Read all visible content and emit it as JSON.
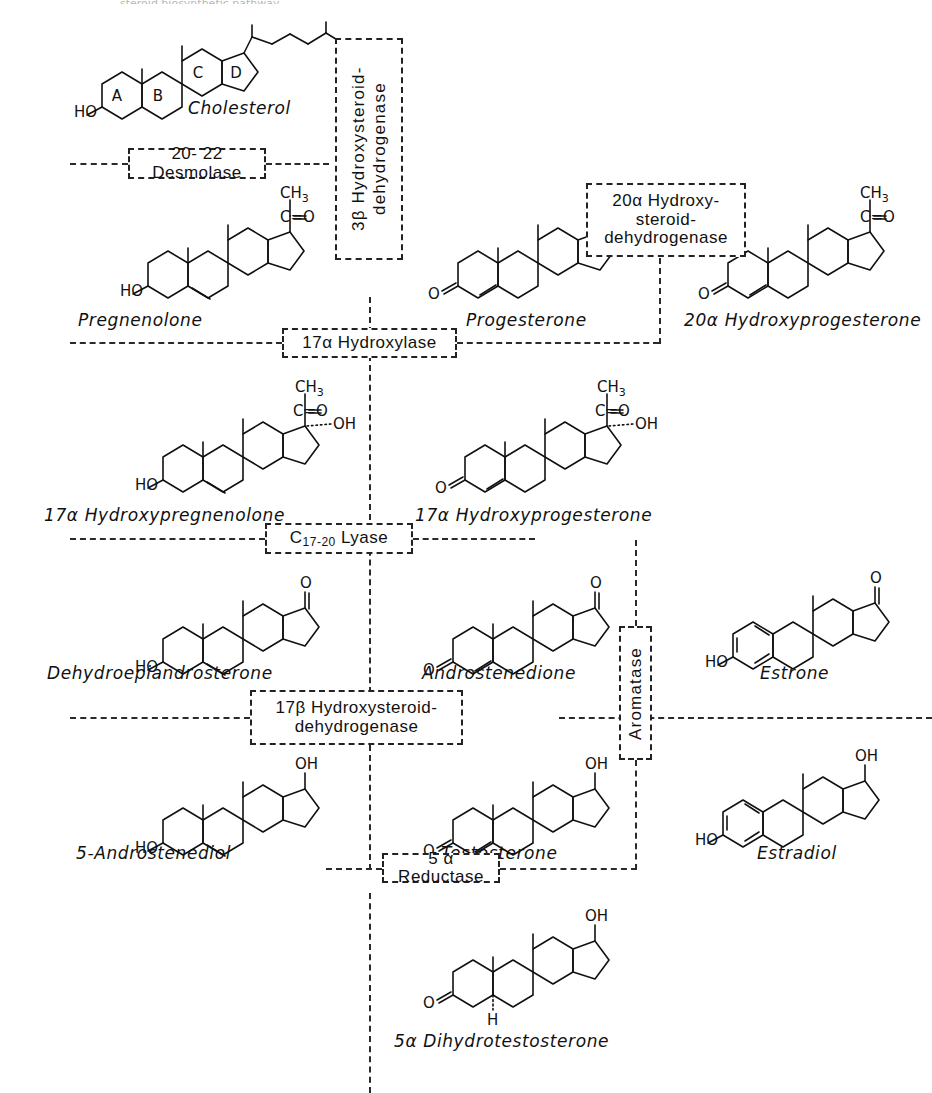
{
  "figure": {
    "title_cropped": "steroid biosynthetic pathway",
    "domain": "biochemistry-pathway-diagram",
    "background_color": "#ffffff",
    "ink_color": "#111111"
  },
  "enzymes": [
    {
      "id": "desmolase",
      "name": "20-22 Desmolase",
      "label": "20- 22 Desmolase",
      "orientation": "horizontal"
    },
    {
      "id": "hsd3b",
      "name": "3-beta Hydroxysteroid dehydrogenase",
      "label": "3β Hydroxysteroid-\ndehydrogenase",
      "orientation": "vertical"
    },
    {
      "id": "hsd20a",
      "name": "20-alpha Hydroxysteroid dehydrogenase",
      "label": "20α Hydroxy-\nsteroid-\ndehydrogenase",
      "orientation": "horizontal"
    },
    {
      "id": "cyp17_hydroxylase",
      "name": "17-alpha Hydroxylase",
      "label": "17α Hydroxylase",
      "orientation": "horizontal"
    },
    {
      "id": "lyase",
      "name": "C17-20 Lyase",
      "label_prefix": "C",
      "label_sub": "17-20",
      "label_suffix": " Lyase",
      "label": "C17-20 Lyase",
      "orientation": "horizontal"
    },
    {
      "id": "hsd17b",
      "name": "17-beta Hydroxysteroid dehydrogenase",
      "label": "17β Hydroxysteroid-\ndehydrogenase",
      "orientation": "horizontal"
    },
    {
      "id": "aromatase",
      "name": "Aromatase",
      "label": "Aromatase",
      "orientation": "vertical"
    },
    {
      "id": "reductase5a",
      "name": "5-alpha Reductase",
      "label": "5 α Reductase",
      "orientation": "horizontal"
    }
  ],
  "compounds": [
    {
      "id": "cholesterol",
      "name": "Cholesterol",
      "row": 1,
      "col": 1
    },
    {
      "id": "pregnenolone",
      "name": "Pregnenolone",
      "row": 2,
      "col": 1
    },
    {
      "id": "progesterone",
      "name": "Progesterone",
      "row": 2,
      "col": 2
    },
    {
      "id": "hydroxyprogesterone20a",
      "name": "20α Hydroxyprogesterone",
      "row": 2,
      "col": 3
    },
    {
      "id": "hydroxypregnenolone17a",
      "name": "17α Hydroxypregnenolone",
      "row": 3,
      "col": 1
    },
    {
      "id": "hydroxyprogesterone17a",
      "name": "17α Hydroxyprogesterone",
      "row": 3,
      "col": 2
    },
    {
      "id": "dhea",
      "name": "Dehydroepiandrosterone",
      "row": 4,
      "col": 1
    },
    {
      "id": "androstenedione",
      "name": "Androstenedione",
      "row": 4,
      "col": 2
    },
    {
      "id": "estrone",
      "name": "Estrone",
      "row": 4,
      "col": 3
    },
    {
      "id": "androstenediol5",
      "name": "5-Androstenediol",
      "row": 5,
      "col": 1
    },
    {
      "id": "testosterone",
      "name": "Testosterone",
      "row": 5,
      "col": 2
    },
    {
      "id": "estradiol",
      "name": "Estradiol",
      "row": 5,
      "col": 3
    },
    {
      "id": "dht",
      "name": "5α Dihydrotestosterone",
      "row": 6,
      "col": 2
    }
  ],
  "ring_letters": [
    "A",
    "B",
    "C",
    "D"
  ],
  "atom_labels": {
    "hydroxyl": "HO",
    "hydroxyl_right": "OH",
    "ketone": "O",
    "methyl": "CH",
    "methyl_sub": "3",
    "carbonyl": "C=O",
    "hydrogen": "H"
  }
}
